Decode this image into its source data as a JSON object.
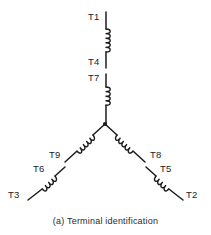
{
  "figure": {
    "caption": "(a)  Terminal identification",
    "caption_letter": "(a)",
    "caption_text": "Terminal identification",
    "type": "wye-connected nine-lead motor winding schematic",
    "line_color": "#1c1c1c",
    "background_color": "#ffffff"
  },
  "terminals": {
    "t1": "T1",
    "t4": "T4",
    "t7": "T7",
    "t9": "T9",
    "t8": "T8",
    "t6": "T6",
    "t5": "T5",
    "t3": "T3",
    "t2": "T2"
  },
  "labels": [
    {
      "id": "t1",
      "text": "T1",
      "x": 88,
      "y": 20
    },
    {
      "id": "t4",
      "text": "T4",
      "x": 88,
      "y": 65
    },
    {
      "id": "t7",
      "text": "T7",
      "x": 88,
      "y": 81
    },
    {
      "id": "t9",
      "text": "T9",
      "x": 49,
      "y": 158
    },
    {
      "id": "t8",
      "text": "T8",
      "x": 150,
      "y": 158
    },
    {
      "id": "t6",
      "text": "T6",
      "x": 33,
      "y": 172
    },
    {
      "id": "t5",
      "text": "T5",
      "x": 160,
      "y": 172
    },
    {
      "id": "t3",
      "text": "T3",
      "x": 8,
      "y": 198
    },
    {
      "id": "t2",
      "text": "T2",
      "x": 186,
      "y": 198
    }
  ],
  "windings": [
    {
      "id": "winding-t1-t4",
      "from": "T1",
      "to": "T4",
      "orientation": "vertical-top"
    },
    {
      "id": "winding-t7-center",
      "from": "T7",
      "to": "center-node",
      "orientation": "vertical-middle"
    },
    {
      "id": "winding-center-t9",
      "from": "center-node",
      "to": "T9",
      "orientation": "diagonal-lower-left"
    },
    {
      "id": "winding-center-t8",
      "from": "center-node",
      "to": "T8",
      "orientation": "diagonal-lower-right"
    },
    {
      "id": "winding-t6-t3",
      "from": "T6",
      "to": "T3",
      "orientation": "diagonal-lower-left"
    },
    {
      "id": "winding-t5-t2",
      "from": "T5",
      "to": "T2",
      "orientation": "diagonal-lower-right"
    }
  ],
  "center_node": {
    "id": "wye-center-node",
    "x": 105,
    "y": 124
  }
}
